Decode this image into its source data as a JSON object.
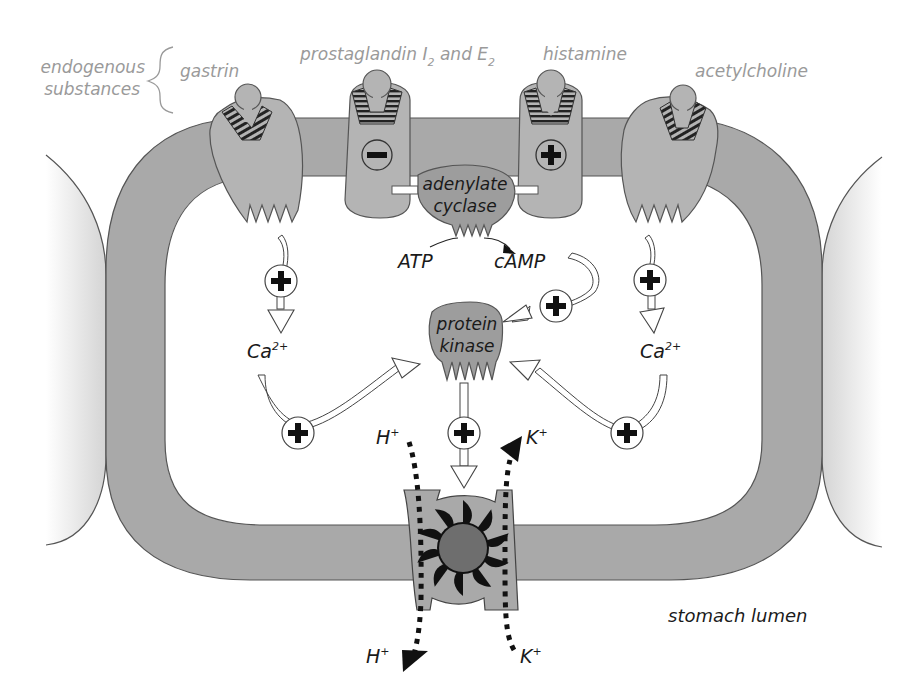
{
  "diagram": {
    "colors": {
      "membrane": "#a9a9a9",
      "membrane_stroke": "#555555",
      "receptor": "#b4b4b4",
      "enzyme": "#9d9d9d",
      "pump_core": "#6e6e6e",
      "pump_blades": "#111111",
      "label_grey": "#9a9a9a",
      "label_dark": "#1a1a1a",
      "arrow_fill": "#ffffff",
      "background": "#ffffff"
    },
    "header": {
      "group_label_line1": "endogenous",
      "group_label_line2": "substances"
    },
    "ligands": [
      {
        "id": "gastrin",
        "label": "gastrin",
        "effect": "+"
      },
      {
        "id": "prostaglandin",
        "label_main": "prostaglandin I",
        "label_sub1": "2",
        "label_mid": " and E",
        "label_sub2": "2",
        "effect": "−"
      },
      {
        "id": "histamine",
        "label": "histamine",
        "effect": "+"
      },
      {
        "id": "acetylcholine",
        "label": "acetylcholine",
        "effect": "+"
      }
    ],
    "enzymes": {
      "adenylate_cyclase_line1": "adenylate",
      "adenylate_cyclase_line2": "cyclase",
      "protein_kinase_line1": "protein",
      "protein_kinase_line2": "kinase"
    },
    "signals": {
      "substrate": "ATP",
      "product": "cAMP",
      "calcium_left_base": "Ca",
      "calcium_left_sup": "2+",
      "calcium_right_base": "Ca",
      "calcium_right_sup": "2+"
    },
    "effect_symbols": {
      "plus": "+",
      "minus": "−"
    },
    "ions": {
      "h_in_base": "H",
      "h_in_sup": "+",
      "k_in_base": "K",
      "k_in_sup": "+",
      "h_out_base": "H",
      "h_out_sup": "+",
      "k_out_base": "K",
      "k_out_sup": "+"
    },
    "compartments": {
      "lumen": "stomach lumen"
    }
  }
}
